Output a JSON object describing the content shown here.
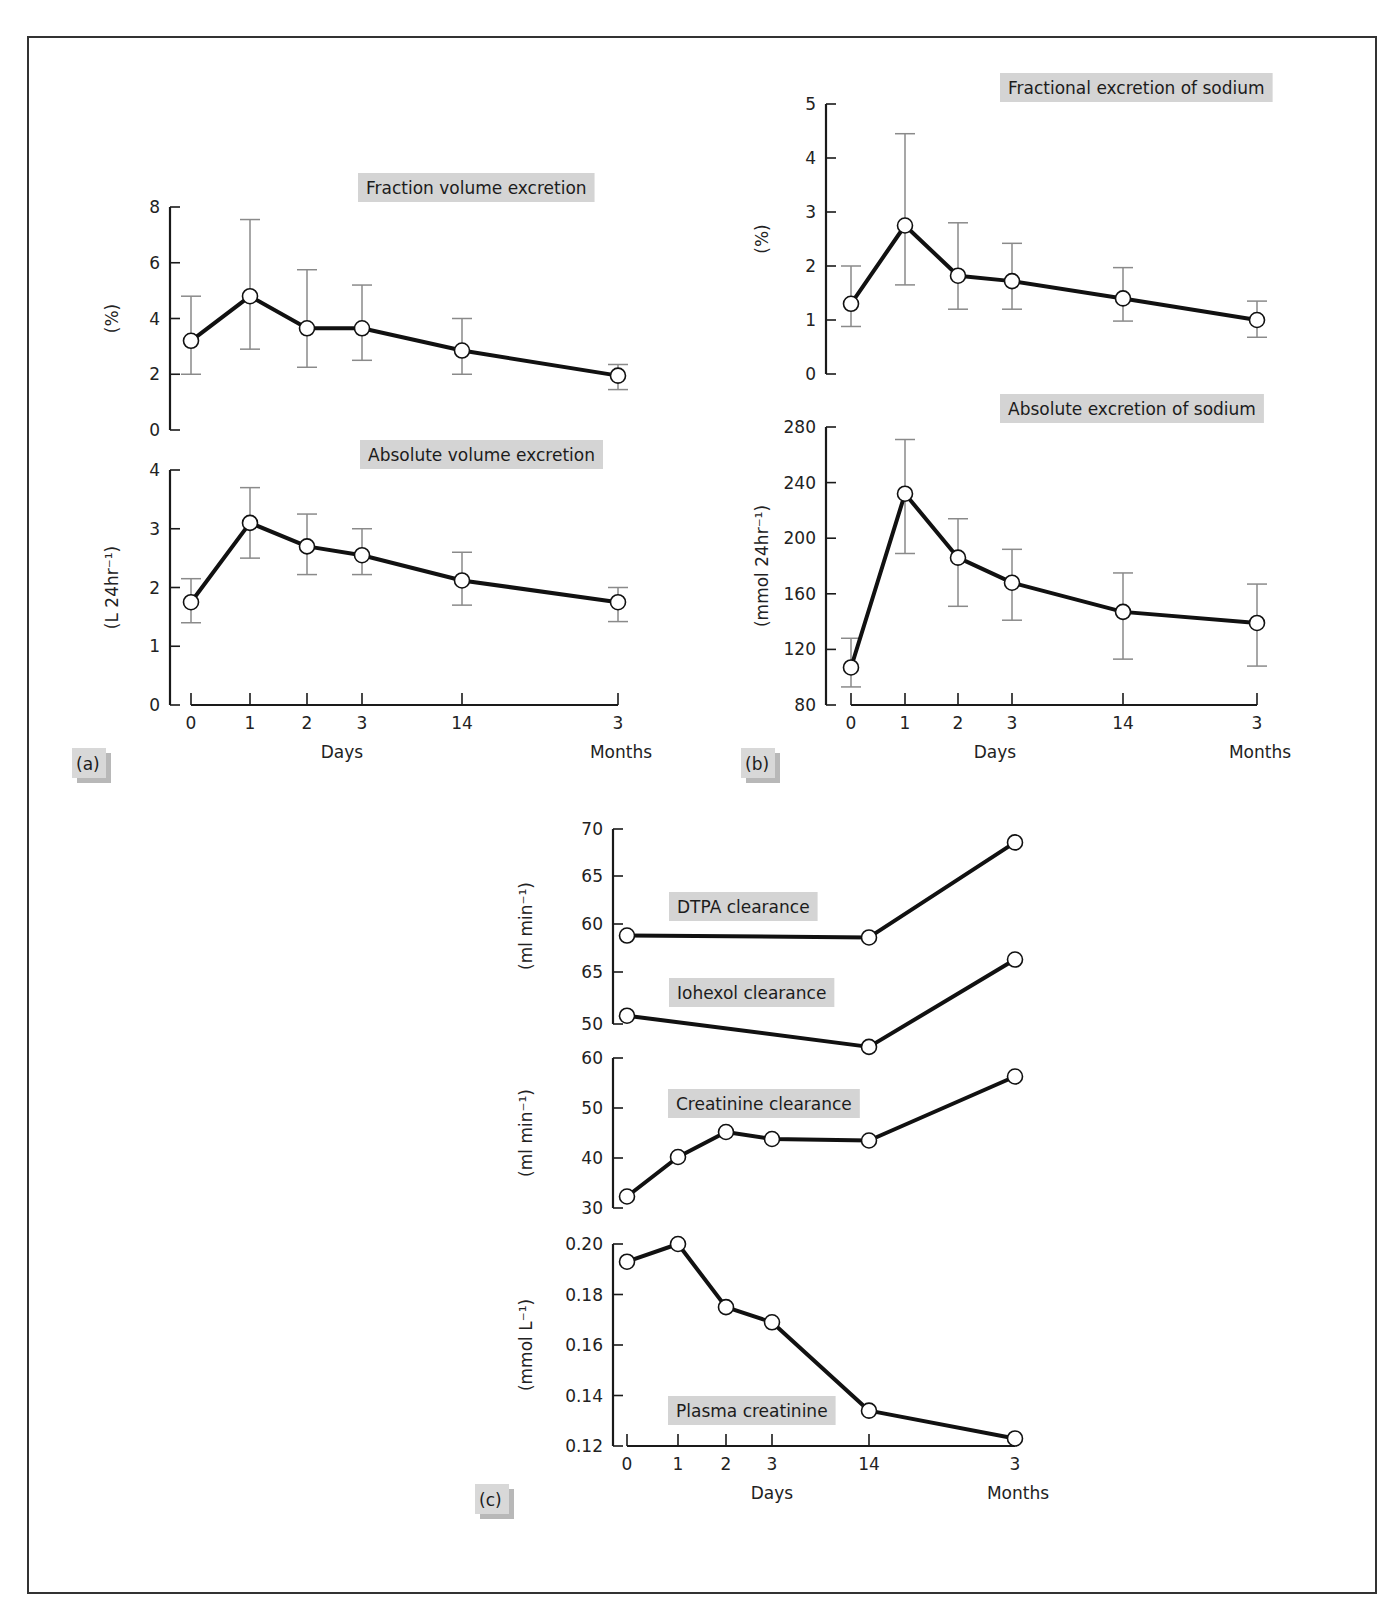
{
  "figure": {
    "header": "",
    "panels": [
      "(a)",
      "(b)",
      "(c)"
    ]
  },
  "chart_data": [
    {
      "type": "line",
      "panel": "(a)",
      "title": "Fraction volume excretion",
      "ylabel": "(%)",
      "xlabel": "Days",
      "x_label_secondary": "Months",
      "categories": [
        "0",
        "1",
        "2",
        "3",
        "14",
        "3"
      ],
      "category_units": [
        "Days",
        "Days",
        "Days",
        "Days",
        "Days",
        "Months"
      ],
      "yticks": [
        0,
        2,
        4,
        6,
        8
      ],
      "ylim": [
        0,
        8
      ],
      "values": [
        3.2,
        4.8,
        3.65,
        3.65,
        2.85,
        1.95
      ],
      "error_low": [
        2.0,
        2.9,
        2.25,
        2.5,
        2.0,
        1.45
      ],
      "error_high": [
        4.8,
        7.55,
        5.75,
        5.2,
        4.0,
        2.35
      ]
    },
    {
      "type": "line",
      "panel": "(a)",
      "title": "Absolute volume excretion",
      "ylabel": "(L 24hr⁻¹)",
      "xlabel": "Days",
      "x_label_secondary": "Months",
      "categories": [
        "0",
        "1",
        "2",
        "3",
        "14",
        "3"
      ],
      "yticks": [
        0,
        1,
        2,
        3,
        4
      ],
      "ylim": [
        0,
        4
      ],
      "values": [
        1.75,
        3.1,
        2.7,
        2.55,
        2.12,
        1.75
      ],
      "error_low": [
        1.4,
        2.5,
        2.22,
        2.22,
        1.7,
        1.42
      ],
      "error_high": [
        2.15,
        3.7,
        3.25,
        3.0,
        2.6,
        2.0
      ]
    },
    {
      "type": "line",
      "panel": "(b)",
      "title": "Fractional excretion  of sodium",
      "ylabel": "(%)",
      "xlabel": "Days",
      "x_label_secondary": "Months",
      "categories": [
        "0",
        "1",
        "2",
        "3",
        "14",
        "3"
      ],
      "yticks": [
        0,
        1,
        2,
        3,
        4,
        5
      ],
      "ylim": [
        0,
        5
      ],
      "values": [
        1.3,
        2.75,
        1.82,
        1.72,
        1.4,
        1.0
      ],
      "error_low": [
        0.88,
        1.65,
        1.2,
        1.2,
        0.98,
        0.68
      ],
      "error_high": [
        2.0,
        4.45,
        2.8,
        2.42,
        1.97,
        1.35
      ]
    },
    {
      "type": "line",
      "panel": "(b)",
      "title": "Absolute excretion of sodium",
      "ylabel": "(mmol 24hr⁻¹)",
      "xlabel": "Days",
      "x_label_secondary": "Months",
      "categories": [
        "0",
        "1",
        "2",
        "3",
        "14",
        "3"
      ],
      "yticks": [
        80,
        120,
        160,
        200,
        240,
        280
      ],
      "ylim": [
        80,
        280
      ],
      "values": [
        107,
        232,
        186,
        168,
        147,
        139
      ],
      "error_low": [
        93,
        189,
        151,
        141,
        113,
        108
      ],
      "error_high": [
        128,
        271,
        214,
        192,
        175,
        167
      ]
    },
    {
      "type": "line",
      "panel": "(c)",
      "title": "DTPA clearance / Iohexol clearance",
      "ylabel": "(ml min⁻¹)",
      "ytick_labels": [
        "70",
        "65",
        "60",
        "65",
        "50"
      ],
      "series": [
        {
          "name": "DTPA clearance",
          "x": [
            "0 days",
            "14 days",
            "3 months"
          ],
          "values": [
            58.8,
            58.6,
            68.5
          ]
        },
        {
          "name": "Iohexol clearance",
          "x": [
            "0 days",
            "14 days",
            "3 months"
          ],
          "values": [
            50.8,
            47.8,
            56.2
          ]
        }
      ]
    },
    {
      "type": "line",
      "panel": "(c)",
      "title": "Creatinine clearance",
      "ylabel": "(ml min⁻¹)",
      "yticks": [
        30,
        40,
        50,
        60
      ],
      "ylim": [
        30,
        60
      ],
      "categories": [
        "0",
        "1",
        "2",
        "3",
        "14",
        "3"
      ],
      "values": [
        32.3,
        40.2,
        45.2,
        43.8,
        43.5,
        56.3
      ]
    },
    {
      "type": "line",
      "panel": "(c)",
      "title": "Plasma creatinine",
      "ylabel": "(mmol L⁻¹)",
      "xlabel": "Days",
      "x_label_secondary": "Months",
      "yticks": [
        "0.12",
        "0.14",
        "0.16",
        "0.18",
        "0.20"
      ],
      "ylim": [
        0.12,
        0.2
      ],
      "categories": [
        "0",
        "1",
        "2",
        "3",
        "14",
        "3"
      ],
      "values": [
        0.193,
        0.2,
        0.175,
        0.169,
        0.134,
        0.123
      ]
    }
  ]
}
